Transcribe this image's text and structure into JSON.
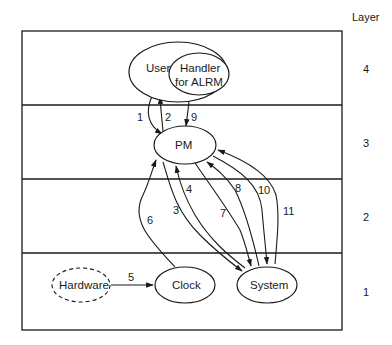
{
  "layer_header": "Layer",
  "layers": [
    {
      "id": "4",
      "label": "4"
    },
    {
      "id": "3",
      "label": "3"
    },
    {
      "id": "2",
      "label": "2"
    },
    {
      "id": "1",
      "label": "1"
    }
  ],
  "nodes": {
    "user": "User",
    "handler_line1": "Handler",
    "handler_line2": "for ALRM",
    "pm": "PM",
    "hardware": "Hardware",
    "clock": "Clock",
    "system": "System"
  },
  "edges": [
    {
      "label": "1",
      "from": "User",
      "to": "PM"
    },
    {
      "label": "2",
      "from": "PM",
      "to": "User"
    },
    {
      "label": "3",
      "from": "PM",
      "to": "System"
    },
    {
      "label": "4",
      "from": "System",
      "to": "PM"
    },
    {
      "label": "5",
      "from": "Hardware",
      "to": "Clock"
    },
    {
      "label": "6",
      "from": "Clock",
      "to": "PM"
    },
    {
      "label": "7",
      "from": "PM",
      "to": "System"
    },
    {
      "label": "8",
      "from": "System",
      "to": "PM"
    },
    {
      "label": "9",
      "from": "Handler for ALRM",
      "to": "PM"
    },
    {
      "label": "10",
      "from": "PM",
      "to": "System"
    },
    {
      "label": "11",
      "from": "System",
      "to": "PM"
    }
  ],
  "edge_labels": {
    "e1": "1",
    "e2": "2",
    "e3": "3",
    "e4": "4",
    "e5": "5",
    "e6": "6",
    "e7": "7",
    "e8": "8",
    "e9": "9",
    "e10": "10",
    "e11": "11"
  }
}
